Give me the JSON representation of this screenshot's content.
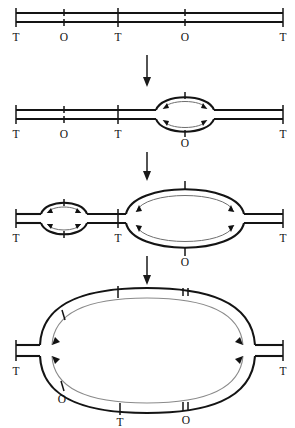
{
  "figure": {
    "background_color": "#ffffff",
    "strand_color": "#141414",
    "daughter_strand_color": "#8a8a8a",
    "arrow_color": "#1a1a1a",
    "label_color": "#111111"
  },
  "legend_keys": {
    "terminus": "T",
    "origin": "O"
  },
  "panels": [
    {
      "id": "panel-1",
      "caption": "unreplicated duplex",
      "sites": [
        {
          "type": "T",
          "label": "T",
          "x": 16
        },
        {
          "type": "O",
          "label": "O",
          "x": 64
        },
        {
          "type": "T",
          "label": "T",
          "x": 118
        },
        {
          "type": "O",
          "label": "O",
          "x": 185
        },
        {
          "type": "T",
          "label": "T",
          "x": 283
        }
      ],
      "bubbles": []
    },
    {
      "id": "panel-2",
      "caption": "first origin fired",
      "sites": [
        {
          "type": "T",
          "label": "T",
          "x": 16
        },
        {
          "type": "O",
          "label": "O",
          "x": 64
        },
        {
          "type": "T",
          "label": "T",
          "x": 118
        },
        {
          "type": "O",
          "label": "O",
          "x": 185
        },
        {
          "type": "T",
          "label": "T",
          "x": 283
        }
      ],
      "bubbles": [
        {
          "center_x": 185,
          "half_width": 29,
          "half_height": 14,
          "origin_label": "O"
        }
      ]
    },
    {
      "id": "panel-3",
      "caption": "second origin fired, first bubble enlarged",
      "sites": [
        {
          "type": "T",
          "label": "T",
          "x": 16
        },
        {
          "type": "O",
          "label": "O",
          "x": 64
        },
        {
          "type": "T",
          "label": "T",
          "x": 118
        },
        {
          "type": "O",
          "label": "O",
          "x": 185
        },
        {
          "type": "T",
          "label": "T",
          "x": 283
        }
      ],
      "bubbles": [
        {
          "center_x": 64,
          "half_width": 25,
          "half_height": 13,
          "origin_label": "O"
        },
        {
          "center_x": 185,
          "half_width": 62,
          "half_height": 33,
          "origin_label": "O"
        }
      ]
    },
    {
      "id": "panel-4",
      "caption": "bubbles merged into one large replication eye",
      "sites": [
        {
          "type": "T",
          "label": "T",
          "x": 16
        },
        {
          "type": "O",
          "label": "O",
          "x": 62
        },
        {
          "type": "T",
          "label": "T",
          "x": 118
        },
        {
          "type": "O",
          "label": "O",
          "x": 185
        },
        {
          "type": "T",
          "label": "T",
          "x": 283
        }
      ],
      "bubbles": [
        {
          "center_x": 147,
          "half_width": 125,
          "half_height": 62,
          "origin_label": "O"
        }
      ]
    }
  ],
  "stage_arrows": [
    {
      "id": "arrow-1-2",
      "from_panel": "panel-1",
      "to_panel": "panel-2",
      "direction": "down"
    },
    {
      "id": "arrow-2-3",
      "from_panel": "panel-2",
      "to_panel": "panel-3",
      "direction": "down"
    },
    {
      "id": "arrow-3-4",
      "from_panel": "panel-3",
      "to_panel": "panel-4",
      "direction": "down"
    }
  ]
}
